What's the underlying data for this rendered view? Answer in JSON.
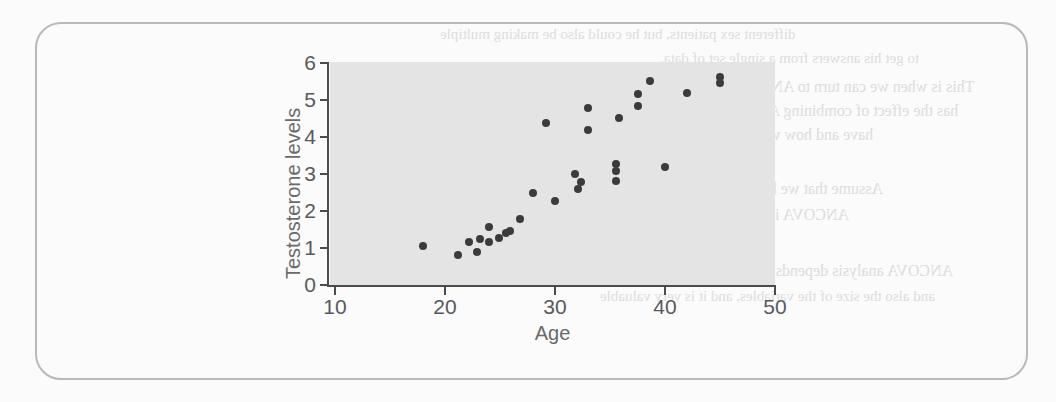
{
  "figure": {
    "frame": {
      "border_color": "#b8b9ba"
    },
    "background_color": "#fbfbfb"
  },
  "bleed_text": [
    {
      "text": "different sex patients, but he could also be making multiple",
      "x": 440,
      "y": 26,
      "size": 15
    },
    {
      "text": "to get his answers from a single set of data.",
      "x": 660,
      "y": 50,
      "size": 15
    },
    {
      "text": "This is when we can turn to ANCOVA, because ANCOVA",
      "x": 600,
      "y": 78,
      "size": 16
    },
    {
      "text": "has the effect of combining ANOVA and regression. We",
      "x": 600,
      "y": 102,
      "size": 16
    },
    {
      "text": "have and how we want to explore the data.",
      "x": 600,
      "y": 126,
      "size": 16
    },
    {
      "text": "reduce cross-contamination",
      "x": 600,
      "y": 150,
      "size": 15
    },
    {
      "text": "Assume that we have a set of data where we",
      "x": 600,
      "y": 180,
      "size": 16
    },
    {
      "text": "ANCOVA is still in this category is the",
      "x": 600,
      "y": 206,
      "size": 16
    },
    {
      "text": "variables in the study",
      "x": 640,
      "y": 232,
      "size": 15
    },
    {
      "text": "ANCOVA analysis depends on the shapes of the patterns",
      "x": 590,
      "y": 262,
      "size": 16
    },
    {
      "text": "and also the size of the variables, and it is very valuable",
      "x": 600,
      "y": 288,
      "size": 15
    }
  ],
  "chart_data": {
    "type": "scatter",
    "title": "",
    "xlabel": "Age",
    "ylabel": "Testosterone levels",
    "xlim": [
      10,
      50
    ],
    "ylim": [
      0,
      6
    ],
    "xticks": [
      10,
      20,
      30,
      40,
      50
    ],
    "yticks": [
      0,
      1,
      2,
      3,
      4,
      5,
      6
    ],
    "grid": false,
    "legend": null,
    "plot_background_color": "#e4e4e4",
    "point_color": "#3b3b3d",
    "points": [
      {
        "x": 18.0,
        "y": 1.05
      },
      {
        "x": 21.2,
        "y": 0.8
      },
      {
        "x": 22.2,
        "y": 1.15
      },
      {
        "x": 22.9,
        "y": 0.9
      },
      {
        "x": 23.2,
        "y": 1.25
      },
      {
        "x": 24.0,
        "y": 1.15
      },
      {
        "x": 24.0,
        "y": 1.58
      },
      {
        "x": 24.9,
        "y": 1.27
      },
      {
        "x": 25.5,
        "y": 1.4
      },
      {
        "x": 25.9,
        "y": 1.47
      },
      {
        "x": 26.8,
        "y": 1.78
      },
      {
        "x": 28.0,
        "y": 2.5
      },
      {
        "x": 29.2,
        "y": 4.38
      },
      {
        "x": 30.0,
        "y": 2.28
      },
      {
        "x": 31.8,
        "y": 3.0
      },
      {
        "x": 32.1,
        "y": 2.6
      },
      {
        "x": 32.4,
        "y": 2.78
      },
      {
        "x": 33.0,
        "y": 4.18
      },
      {
        "x": 33.0,
        "y": 4.78
      },
      {
        "x": 35.5,
        "y": 3.08
      },
      {
        "x": 35.5,
        "y": 3.28
      },
      {
        "x": 35.5,
        "y": 2.82
      },
      {
        "x": 35.8,
        "y": 4.52
      },
      {
        "x": 37.5,
        "y": 5.15
      },
      {
        "x": 37.5,
        "y": 4.85
      },
      {
        "x": 38.6,
        "y": 5.52
      },
      {
        "x": 40.0,
        "y": 3.2
      },
      {
        "x": 42.0,
        "y": 5.18
      },
      {
        "x": 45.0,
        "y": 5.62
      },
      {
        "x": 45.0,
        "y": 5.45
      }
    ]
  }
}
